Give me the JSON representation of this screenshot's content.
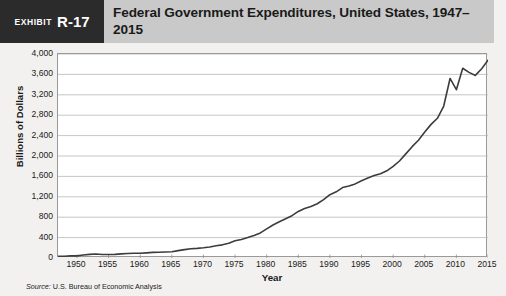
{
  "header": {
    "exhibit_word": "Exhibit",
    "exhibit_number": "R-17",
    "title": "Federal Government Expenditures, United States, 1947–2015",
    "band_color": "#c9c9c9",
    "badge_color": "#2b2b2b"
  },
  "source": {
    "label": "Source:",
    "text": " U.S. Bureau of Economic Analysis"
  },
  "chart_data": {
    "type": "line",
    "title": "Federal Government Expenditures, United States, 1947–2015",
    "xlabel": "Year",
    "ylabel": "Billions of Dollars",
    "xlim": [
      1947,
      2015
    ],
    "ylim": [
      0,
      4000
    ],
    "grid": true,
    "legend": "none",
    "line_color": "#3c3c3c",
    "xticks": [
      1950,
      1955,
      1960,
      1965,
      1970,
      1975,
      1980,
      1985,
      1990,
      1995,
      2000,
      2005,
      2010,
      2015
    ],
    "yticks": [
      0,
      400,
      800,
      1200,
      1600,
      2000,
      2400,
      2800,
      3200,
      3600,
      4000
    ],
    "ytick_labels": [
      "0",
      "400",
      "800",
      "1,200",
      "1,600",
      "2,000",
      "2,400",
      "2,800",
      "3,200",
      "3,600",
      "4,000"
    ],
    "series": [
      {
        "name": "Federal Government Expenditures",
        "x": [
          1947,
          1948,
          1949,
          1950,
          1951,
          1952,
          1953,
          1954,
          1955,
          1956,
          1957,
          1958,
          1959,
          1960,
          1961,
          1962,
          1963,
          1964,
          1965,
          1966,
          1967,
          1968,
          1969,
          1970,
          1971,
          1972,
          1973,
          1974,
          1975,
          1976,
          1977,
          1978,
          1979,
          1980,
          1981,
          1982,
          1983,
          1984,
          1985,
          1986,
          1987,
          1988,
          1989,
          1990,
          1991,
          1992,
          1993,
          1994,
          1995,
          1996,
          1997,
          1998,
          1999,
          2000,
          2001,
          2002,
          2003,
          2004,
          2005,
          2006,
          2007,
          2008,
          2009,
          2010,
          2011,
          2012,
          2013,
          2014,
          2015
        ],
        "values": [
          34,
          34,
          41,
          41,
          58,
          72,
          77,
          70,
          69,
          72,
          80,
          87,
          92,
          93,
          101,
          110,
          114,
          119,
          124,
          144,
          164,
          181,
          189,
          201,
          216,
          239,
          258,
          288,
          337,
          364,
          401,
          443,
          492,
          570,
          648,
          709,
          770,
          830,
          913,
          971,
          1012,
          1063,
          1144,
          1242,
          1298,
          1381,
          1413,
          1453,
          1516,
          1570,
          1616,
          1653,
          1709,
          1797,
          1902,
          2042,
          2183,
          2310,
          2469,
          2620,
          2740,
          2980,
          3520,
          3300,
          3720,
          3640,
          3580,
          3710,
          3880
        ],
        "annotations": [
          {
            "year": 2009,
            "note": "sharp stimulus spike to about 3,500"
          },
          {
            "year": 2010,
            "note": "dip back to about 3,300"
          },
          {
            "year": 2015,
            "note": "ends near 3,900"
          }
        ]
      }
    ]
  }
}
